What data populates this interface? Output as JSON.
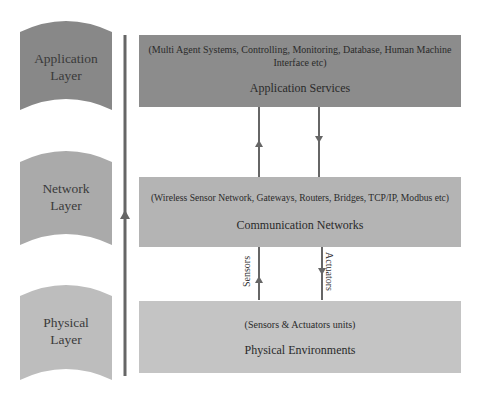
{
  "layers": [
    {
      "label_line1": "Application",
      "label_line2": "Layer",
      "color": "#888888"
    },
    {
      "label_line1": "Network",
      "label_line2": "Layer",
      "color": "#aaaaaa"
    },
    {
      "label_line1": "Physical",
      "label_line2": "Layer",
      "color": "#bdbdbd"
    }
  ],
  "boxes": {
    "application": {
      "subtitle": "(Multi Agent Systems, Controlling, Monitoring, Database, Human Machine Interface etc)",
      "title": "Application Services",
      "color": "#8c8c8c"
    },
    "network": {
      "subtitle": "(Wireless Sensor Network, Gateways, Routers, Bridges, TCP/IP, Modbus etc)",
      "title": "Communication Networks",
      "color": "#b4b4b4"
    },
    "physical": {
      "subtitle": "(Sensors & Actuators units)",
      "title": "Physical Environments",
      "color": "#c4c4c4"
    }
  },
  "arrows": {
    "sensors_label": "Sensors",
    "actuators_label": "Actuators",
    "line_color": "#666666"
  }
}
